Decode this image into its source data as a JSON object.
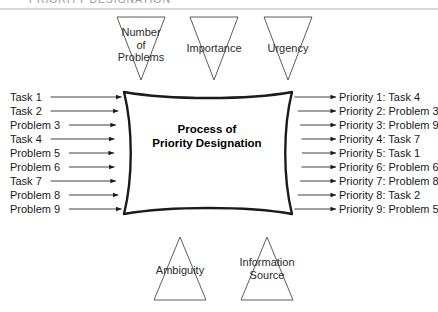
{
  "figure": {
    "title": "PRIORITY DESIGNATION",
    "core_line1": "Process of",
    "core_line2": "Priority Designation",
    "width": 438,
    "height": 312,
    "stroke_color": "#1b1b1b",
    "triangle_stroke": "#4a4a4a",
    "rule_color": "#d7d7d7",
    "title_color": "#9a9a9a"
  },
  "top_factors": [
    {
      "id": "number-of-problems",
      "line1": "Number",
      "line2": "of",
      "line3": "Problems",
      "cx": 141,
      "text_y": 26
    },
    {
      "id": "importance",
      "line1": "Importance",
      "line2": "",
      "line3": "",
      "cx": 214,
      "text_y": 42
    },
    {
      "id": "urgency",
      "line1": "Urgency",
      "line2": "",
      "line3": "",
      "cx": 288,
      "text_y": 42
    }
  ],
  "bottom_factors": [
    {
      "id": "ambiguity",
      "line1": "Ambiguity",
      "line2": "",
      "cx": 180,
      "text_y": 264
    },
    {
      "id": "information-source",
      "line1": "Information",
      "line2": "Source",
      "cx": 267,
      "text_y": 256
    }
  ],
  "inputs": [
    {
      "label": "Task 1",
      "y": 97
    },
    {
      "label": "Task 2",
      "y": 111
    },
    {
      "label": "Problem 3",
      "y": 125
    },
    {
      "label": "Task 4",
      "y": 139
    },
    {
      "label": "Problem 5",
      "y": 153
    },
    {
      "label": "Problem 6",
      "y": 167
    },
    {
      "label": "Task 7",
      "y": 181
    },
    {
      "label": "Problem 8",
      "y": 195
    },
    {
      "label": "Problem 9",
      "y": 209
    }
  ],
  "outputs": [
    {
      "label": "Priority 1: Task 4",
      "y": 97
    },
    {
      "label": "Priority 2: Problem 3",
      "y": 111
    },
    {
      "label": "Priority 3: Problem 9",
      "y": 125
    },
    {
      "label": "Priority 4: Task 7",
      "y": 139
    },
    {
      "label": "Priority 5: Task 1",
      "y": 153
    },
    {
      "label": "Priority 6: Problem 6",
      "y": 167
    },
    {
      "label": "Priority 7: Problem 8",
      "y": 181
    },
    {
      "label": "Priority 8: Task 2",
      "y": 195
    },
    {
      "label": "Priority 9: Problem 5",
      "y": 209
    }
  ]
}
